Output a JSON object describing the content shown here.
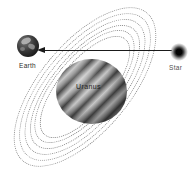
{
  "diagram": {
    "labels": {
      "earth": "Earth",
      "uranus": "Uranus",
      "star": "Star"
    },
    "icons": {
      "arrowhead": "left-pointing-arrowhead",
      "rings": "dotted-orbit-ellipses"
    },
    "colors": {
      "background": "#ffffff",
      "line": "#1a1a1a",
      "ring_dots": "#8f8f8f",
      "uranus_band_dark": "#474747",
      "uranus_band_light": "#c6c6c6",
      "label_text": "#2a2a2a"
    },
    "ring_count": 6
  }
}
